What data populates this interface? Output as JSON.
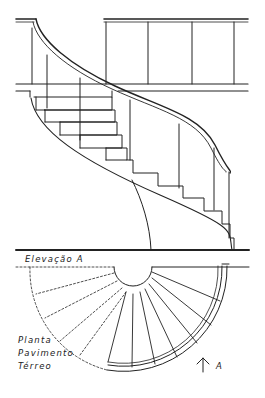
{
  "drawing": {
    "type": "architectural drawing",
    "subject": "spiral staircase",
    "line_color": "#222222",
    "background": "#ffffff"
  },
  "labels": {
    "elevation": "Elevação A",
    "plan_line1": "Planta",
    "plan_line2": "Pavimento",
    "plan_line3": "Térreo",
    "section_marker": "A"
  }
}
